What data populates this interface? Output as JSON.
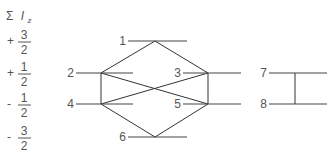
{
  "axis": {
    "title_sigma": "Σ",
    "title_var": "I",
    "title_sub": "z",
    "values": [
      {
        "sign": "+",
        "num": "3",
        "den": "2",
        "y": 41
      },
      {
        "sign": "+",
        "num": "1",
        "den": "2",
        "y": 73
      },
      {
        "sign": "-",
        "num": "1",
        "den": "2",
        "y": 104
      },
      {
        "sign": "-",
        "num": "3",
        "den": "2",
        "y": 137
      }
    ]
  },
  "levels": [
    {
      "id": "1",
      "label": "1",
      "x1": 128,
      "x2": 187,
      "y": 41,
      "vx": 155
    },
    {
      "id": "2",
      "label": "2",
      "x1": 76,
      "x2": 133,
      "y": 73,
      "vx": 101
    },
    {
      "id": "3",
      "label": "3",
      "x1": 183,
      "x2": 241,
      "y": 73,
      "vx": 208
    },
    {
      "id": "4",
      "label": "4",
      "x1": 76,
      "x2": 133,
      "y": 104,
      "vx": 101
    },
    {
      "id": "5",
      "label": "5",
      "x1": 183,
      "x2": 241,
      "y": 104,
      "vx": 208
    },
    {
      "id": "6",
      "label": "6",
      "x1": 128,
      "x2": 187,
      "y": 137,
      "vx": 155
    },
    {
      "id": "7",
      "label": "7",
      "x1": 269,
      "x2": 327,
      "y": 73,
      "vx": 295
    },
    {
      "id": "8",
      "label": "8",
      "x1": 269,
      "x2": 327,
      "y": 104,
      "vx": 295
    }
  ],
  "transitions": [
    [
      "1",
      "2"
    ],
    [
      "1",
      "3"
    ],
    [
      "2",
      "4"
    ],
    [
      "2",
      "5"
    ],
    [
      "3",
      "4"
    ],
    [
      "3",
      "5"
    ],
    [
      "4",
      "6"
    ],
    [
      "5",
      "6"
    ],
    [
      "7",
      "8"
    ]
  ],
  "colors": {
    "line": "#333333",
    "text": "#555555"
  }
}
